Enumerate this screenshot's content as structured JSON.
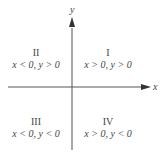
{
  "diagram": {
    "title": "",
    "axes": {
      "x_label": "x",
      "y_label": "y",
      "color": "#555555"
    },
    "quadrants": [
      {
        "numeral": "I",
        "condition": "x > 0, y > 0"
      },
      {
        "numeral": "II",
        "condition": "x < 0, y > 0"
      },
      {
        "numeral": "III",
        "condition": "x < 0, y < 0"
      },
      {
        "numeral": "IV",
        "condition": "x > 0, y < 0"
      }
    ]
  }
}
